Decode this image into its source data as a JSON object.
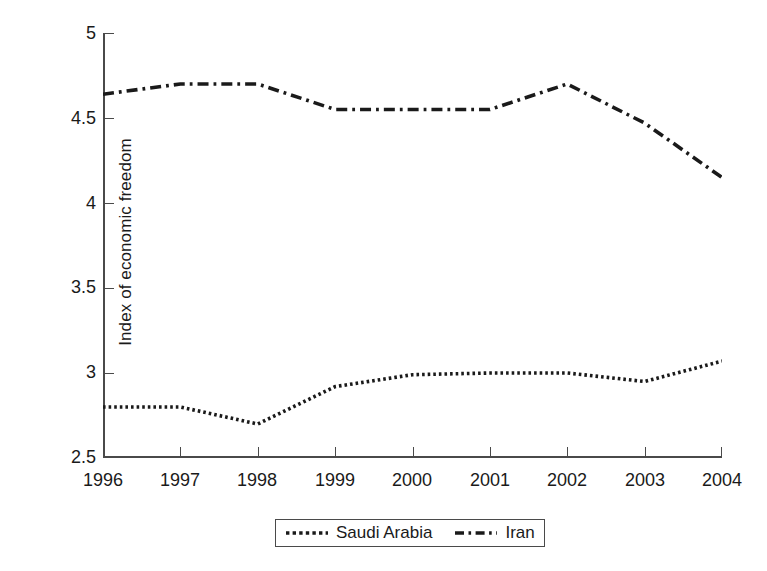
{
  "chart_data": {
    "type": "line",
    "title": "",
    "xlabel": "",
    "ylabel": "Index of economic freedom",
    "x": [
      1996,
      1997,
      1998,
      1999,
      2000,
      2001,
      2002,
      2003,
      2004
    ],
    "xtick_labels": [
      "1996",
      "1997",
      "1998",
      "1999",
      "2000",
      "2001",
      "2002",
      "2003",
      "2004"
    ],
    "ytick_labels": [
      "2.5",
      "3",
      "3.5",
      "4",
      "4.5",
      "5"
    ],
    "yticks": [
      2.5,
      3,
      3.5,
      4,
      4.5,
      5
    ],
    "xlim": [
      1996,
      2004
    ],
    "ylim": [
      2.5,
      5
    ],
    "grid": false,
    "legend_position": "below-center",
    "series": [
      {
        "name": "Saudi Arabia",
        "linestyle": "dotted",
        "color": "#1a1a1a",
        "values": [
          2.8,
          2.8,
          2.7,
          2.92,
          2.99,
          3.0,
          3.0,
          2.95,
          3.07
        ]
      },
      {
        "name": "Iran",
        "linestyle": "dash-dot",
        "color": "#1a1a1a",
        "values": [
          4.64,
          4.7,
          4.7,
          4.55,
          4.55,
          4.55,
          4.7,
          4.47,
          4.15
        ]
      }
    ]
  },
  "axes": {
    "y_title": "Index of economic freedom",
    "y_tick_labels": [
      "5",
      "4.5",
      "4",
      "3.5",
      "3",
      "2.5"
    ],
    "x_tick_labels": [
      "1996",
      "1997",
      "1998",
      "1999",
      "2000",
      "2001",
      "2002",
      "2003",
      "2004"
    ]
  },
  "legend": {
    "items": [
      {
        "label": "Saudi Arabia",
        "style": "dotted"
      },
      {
        "label": "Iran",
        "style": "dash-dot"
      }
    ]
  },
  "colors": {
    "ink": "#1a1a1a",
    "axis": "#4a4a4a",
    "background": "#ffffff"
  }
}
